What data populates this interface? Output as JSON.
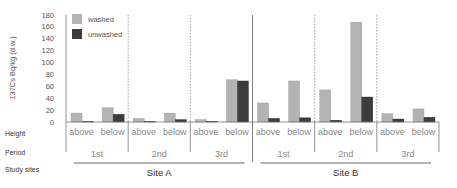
{
  "chart_data": {
    "type": "bar",
    "title": "",
    "ylabel": "137Cs Bq/kg (d.w.)",
    "xlabel": "",
    "ylim": [
      0,
      180
    ],
    "yticks": [
      0,
      20,
      40,
      60,
      80,
      100,
      120,
      140,
      160,
      180
    ],
    "grid": false,
    "legend_position": "top-left inside",
    "row_labels": {
      "height": "Height",
      "period": "Period",
      "sites": "Study sites"
    },
    "categories": [
      {
        "site": "Site A",
        "period": "1st",
        "height": "above"
      },
      {
        "site": "Site A",
        "period": "1st",
        "height": "below"
      },
      {
        "site": "Site A",
        "period": "2nd",
        "height": "above"
      },
      {
        "site": "Site A",
        "period": "2nd",
        "height": "below"
      },
      {
        "site": "Site A",
        "period": "3rd",
        "height": "above"
      },
      {
        "site": "Site A",
        "period": "3rd",
        "height": "below"
      },
      {
        "site": "Site B",
        "period": "1st",
        "height": "above"
      },
      {
        "site": "Site B",
        "period": "1st",
        "height": "below"
      },
      {
        "site": "Site B",
        "period": "2nd",
        "height": "above"
      },
      {
        "site": "Site B",
        "period": "2nd",
        "height": "below"
      },
      {
        "site": "Site B",
        "period": "3rd",
        "height": "above"
      },
      {
        "site": "Site B",
        "period": "3rd",
        "height": "below"
      }
    ],
    "series": [
      {
        "name": "washed",
        "color": "#b3b3b3",
        "values": [
          15,
          24,
          6,
          15,
          4,
          71,
          32,
          69,
          54,
          168,
          14,
          22
        ]
      },
      {
        "name": "unwashed",
        "color": "#3c3c3c",
        "values": [
          1,
          13,
          1,
          4,
          1,
          69,
          6,
          7,
          3,
          42,
          5,
          8
        ]
      }
    ],
    "sites": [
      "Site A",
      "Site B"
    ],
    "periods": [
      "1st",
      "2nd",
      "3rd"
    ],
    "heights": [
      "above",
      "below"
    ]
  }
}
